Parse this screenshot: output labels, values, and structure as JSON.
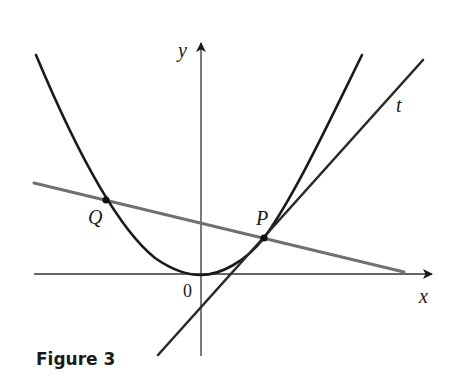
{
  "figure": {
    "caption": "Figure 3",
    "labels": {
      "y_axis": "y",
      "x_axis": "x",
      "origin": "0",
      "point_q": "Q",
      "point_p": "P",
      "tangent": "t"
    },
    "colors": {
      "curve": "#1a1a1a",
      "tangent": "#2a2a2a",
      "secant": "#707070",
      "axes": "#333333",
      "points": "#111111"
    },
    "elements": [
      {
        "name": "parabola",
        "type": "curve",
        "description": "parabola with vertex at origin"
      },
      {
        "name": "tangent-line-t",
        "type": "line",
        "description": "tangent line t at P"
      },
      {
        "name": "secant-line-pq",
        "type": "line",
        "description": "secant line through P and Q"
      },
      {
        "name": "point-p",
        "type": "point"
      },
      {
        "name": "point-q",
        "type": "point"
      }
    ]
  }
}
